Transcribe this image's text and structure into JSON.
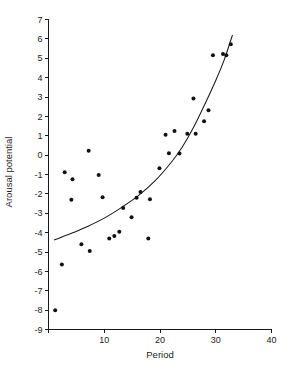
{
  "chart_data": {
    "type": "scatter",
    "title": "",
    "xlabel": "Period",
    "ylabel": "Arousal potential",
    "xlim": [
      0,
      40
    ],
    "ylim": [
      -9,
      7
    ],
    "xticks": [
      0,
      10,
      20,
      30,
      40
    ],
    "xtick_labels": [
      "",
      "10",
      "20",
      "30",
      "40"
    ],
    "yticks": [
      -9,
      -8,
      -7,
      -6,
      -5,
      -4,
      -3,
      -2,
      -1,
      0,
      1,
      2,
      3,
      4,
      5,
      6,
      7
    ],
    "ytick_labels": [
      "-9",
      "-8",
      "-7",
      "-6",
      "-5",
      "-4",
      "-3",
      "-2",
      "-1",
      "0",
      "1",
      "2",
      "3",
      "4",
      "5",
      "6",
      "7"
    ],
    "grid": false,
    "legend": "none",
    "marker": "filled-circle",
    "marker_color": "#111111",
    "curve_color": "#1a1a1a",
    "points": [
      {
        "x": 1.2,
        "y": -8.0
      },
      {
        "x": 2.4,
        "y": -5.65
      },
      {
        "x": 2.9,
        "y": -0.88
      },
      {
        "x": 4.1,
        "y": -2.3
      },
      {
        "x": 4.3,
        "y": -1.25
      },
      {
        "x": 5.9,
        "y": -4.6
      },
      {
        "x": 7.2,
        "y": 0.22
      },
      {
        "x": 7.4,
        "y": -4.95
      },
      {
        "x": 9.0,
        "y": -1.02
      },
      {
        "x": 9.7,
        "y": -2.17
      },
      {
        "x": 10.9,
        "y": -4.3
      },
      {
        "x": 11.8,
        "y": -4.17
      },
      {
        "x": 12.7,
        "y": -3.95
      },
      {
        "x": 13.4,
        "y": -2.73
      },
      {
        "x": 14.9,
        "y": -3.2
      },
      {
        "x": 15.8,
        "y": -2.2
      },
      {
        "x": 16.5,
        "y": -1.9
      },
      {
        "x": 17.9,
        "y": -4.3
      },
      {
        "x": 18.2,
        "y": -2.28
      },
      {
        "x": 19.9,
        "y": -0.68
      },
      {
        "x": 21.0,
        "y": 1.05
      },
      {
        "x": 21.6,
        "y": 0.1
      },
      {
        "x": 22.6,
        "y": 1.25
      },
      {
        "x": 23.5,
        "y": 0.08
      },
      {
        "x": 24.9,
        "y": 1.1
      },
      {
        "x": 26.0,
        "y": 2.92
      },
      {
        "x": 26.4,
        "y": 1.1
      },
      {
        "x": 27.9,
        "y": 1.75
      },
      {
        "x": 28.7,
        "y": 2.32
      },
      {
        "x": 29.5,
        "y": 5.15
      },
      {
        "x": 31.3,
        "y": 5.22
      },
      {
        "x": 31.9,
        "y": 5.15
      },
      {
        "x": 32.7,
        "y": 5.72
      }
    ],
    "curve": {
      "description": "fitted exponential trend line",
      "x_start": 1.0,
      "x_end": 33.0,
      "samples": [
        {
          "x": 1.0,
          "y": -4.38
        },
        {
          "x": 4.0,
          "y": -4.05
        },
        {
          "x": 7.0,
          "y": -3.68
        },
        {
          "x": 10.0,
          "y": -3.25
        },
        {
          "x": 13.0,
          "y": -2.72
        },
        {
          "x": 16.0,
          "y": -2.12
        },
        {
          "x": 19.0,
          "y": -1.36
        },
        {
          "x": 22.0,
          "y": -0.38
        },
        {
          "x": 24.0,
          "y": 0.42
        },
        {
          "x": 26.0,
          "y": 1.42
        },
        {
          "x": 28.0,
          "y": 2.6
        },
        {
          "x": 30.0,
          "y": 3.85
        },
        {
          "x": 31.5,
          "y": 4.9
        },
        {
          "x": 33.0,
          "y": 6.2
        }
      ]
    }
  }
}
